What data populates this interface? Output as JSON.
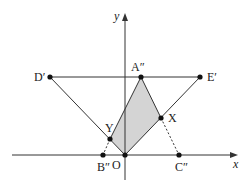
{
  "diagram": {
    "axes": {
      "x_label": "x",
      "y_label": "y"
    },
    "colors": {
      "line": "#333333",
      "shade": "#d4d4d4",
      "point": "#111111"
    },
    "points": [
      {
        "id": "D",
        "label": "D′",
        "x": 50,
        "y": 77
      },
      {
        "id": "A",
        "label": "A″",
        "x": 141,
        "y": 77
      },
      {
        "id": "E",
        "label": "E′",
        "x": 200,
        "y": 77
      },
      {
        "id": "X",
        "label": "X",
        "x": 161,
        "y": 118
      },
      {
        "id": "Y",
        "label": "Y",
        "x": 110,
        "y": 139
      },
      {
        "id": "B",
        "label": "B″",
        "x": 103,
        "y": 155
      },
      {
        "id": "O",
        "label": "O",
        "x": 125,
        "y": 155
      },
      {
        "id": "C",
        "label": "C″",
        "x": 179,
        "y": 155
      }
    ],
    "shaded_region": [
      "A",
      "X",
      "O",
      "Y"
    ]
  }
}
